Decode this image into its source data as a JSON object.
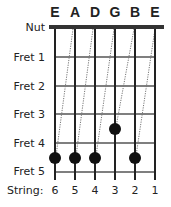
{
  "diagram": {
    "string_names": [
      "E",
      "A",
      "D",
      "G",
      "B",
      "E"
    ],
    "row_labels": {
      "nut": "Nut",
      "frets": [
        "Fret 1",
        "Fret 2",
        "Fret 3",
        "Fret 4",
        "Fret 5"
      ]
    },
    "bottom_label": "String:",
    "string_numbers": [
      "6",
      "5",
      "4",
      "3",
      "2",
      "1"
    ],
    "dots": [
      {
        "string": 6,
        "fret": 5
      },
      {
        "string": 5,
        "fret": 5
      },
      {
        "string": 4,
        "fret": 5
      },
      {
        "string": 3,
        "fret": 4
      },
      {
        "string": 2,
        "fret": 5
      }
    ],
    "tuning_lines": [
      {
        "from_open_string": 5,
        "to_string": 6,
        "to_fret": 5
      },
      {
        "from_open_string": 4,
        "to_string": 5,
        "to_fret": 5
      },
      {
        "from_open_string": 3,
        "to_string": 4,
        "to_fret": 5
      },
      {
        "from_open_string": 2,
        "to_string": 3,
        "to_fret": 4
      },
      {
        "from_open_string": 1,
        "to_string": 2,
        "to_fret": 5
      }
    ],
    "colors": {
      "ink": "#222222",
      "fret": "#555555",
      "dot": "#111111",
      "dotted": "#777777"
    }
  }
}
